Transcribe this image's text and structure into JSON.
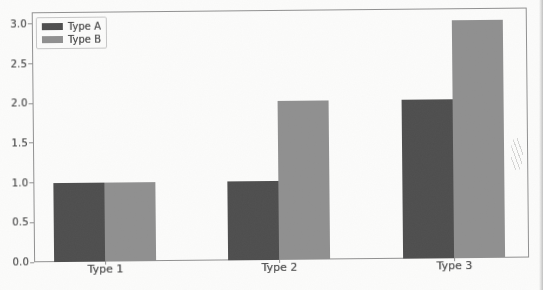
{
  "chart_data": {
    "type": "bar",
    "title": "",
    "xlabel": "",
    "ylabel": "",
    "categories": [
      "Type 1",
      "Type 2",
      "Type 3"
    ],
    "series": [
      {
        "name": "Type A",
        "color": "#4d4d4d",
        "values": [
          1.0,
          1.0,
          2.0
        ]
      },
      {
        "name": "Type B",
        "color": "#8f8f8f",
        "values": [
          1.0,
          2.0,
          3.0
        ]
      }
    ],
    "ylim": [
      0,
      3.15
    ],
    "yticks": [
      0,
      0.5,
      1,
      1.5,
      2,
      2.5,
      3
    ],
    "ytick_labels": [
      "0.0",
      "0.5",
      "1.0",
      "1.5",
      "2.0",
      "2.5",
      "3.0"
    ],
    "grid": false,
    "legend_position": "upper-left"
  },
  "style": {
    "bar_color_type_a": "#4d4d4d",
    "bar_color_type_b": "#8f8f8f",
    "axis_color": "#8f8f8f",
    "text_color": "#4a4a4a",
    "background": "#fcfcfb"
  }
}
